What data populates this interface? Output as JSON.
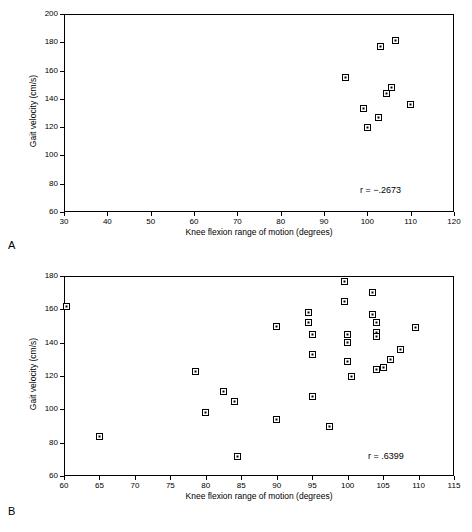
{
  "figure": {
    "panels": [
      {
        "letter": "A",
        "annotation": "r = −.2673",
        "chart_data": {
          "type": "scatter",
          "title": "",
          "xlabel": "Knee flexion range of motion (degrees)",
          "ylabel": "Gait velocity (cm/s)",
          "xlim": [
            30,
            120
          ],
          "ylim": [
            60,
            200
          ],
          "xticks": [
            30,
            40,
            50,
            60,
            70,
            80,
            90,
            100,
            110,
            120
          ],
          "yticks": [
            60,
            80,
            100,
            120,
            140,
            160,
            180,
            200
          ],
          "grid": false,
          "legend": "none",
          "annotations": [
            "r = −.2673"
          ],
          "points": [
            {
              "x": 95.0,
              "y": 155.0
            },
            {
              "x": 99.0,
              "y": 133.0
            },
            {
              "x": 100.0,
              "y": 120.0
            },
            {
              "x": 102.5,
              "y": 127.0
            },
            {
              "x": 103.0,
              "y": 177.0
            },
            {
              "x": 104.5,
              "y": 144.0
            },
            {
              "x": 105.5,
              "y": 148.0
            },
            {
              "x": 106.5,
              "y": 181.0
            },
            {
              "x": 110.0,
              "y": 136.0
            }
          ]
        }
      },
      {
        "letter": "B",
        "annotation": "r = .6399",
        "chart_data": {
          "type": "scatter",
          "title": "",
          "xlabel": "Knee flexion range of motion (degrees)",
          "ylabel": "Gait velocity (cm/s)",
          "xlim": [
            60,
            115
          ],
          "ylim": [
            60,
            180
          ],
          "xticks": [
            60,
            65,
            70,
            75,
            80,
            85,
            90,
            95,
            100,
            105,
            110,
            115
          ],
          "yticks": [
            60,
            80,
            100,
            120,
            140,
            160,
            180
          ],
          "grid": false,
          "legend": "none",
          "annotations": [
            "r = .6399"
          ],
          "points": [
            {
              "x": 60.3,
              "y": 162.0
            },
            {
              "x": 65.0,
              "y": 84.0
            },
            {
              "x": 78.5,
              "y": 123.0
            },
            {
              "x": 80.0,
              "y": 98.0
            },
            {
              "x": 82.5,
              "y": 111.0
            },
            {
              "x": 84.0,
              "y": 105.0
            },
            {
              "x": 84.5,
              "y": 72.0
            },
            {
              "x": 90.0,
              "y": 150.0
            },
            {
              "x": 90.0,
              "y": 94.0
            },
            {
              "x": 94.5,
              "y": 158.0
            },
            {
              "x": 94.5,
              "y": 152.0
            },
            {
              "x": 95.0,
              "y": 145.0
            },
            {
              "x": 95.0,
              "y": 133.0
            },
            {
              "x": 95.0,
              "y": 108.0
            },
            {
              "x": 97.5,
              "y": 90.0
            },
            {
              "x": 99.5,
              "y": 177.0
            },
            {
              "x": 99.5,
              "y": 165.0
            },
            {
              "x": 100.0,
              "y": 145.0
            },
            {
              "x": 100.0,
              "y": 140.0
            },
            {
              "x": 100.0,
              "y": 129.0
            },
            {
              "x": 100.5,
              "y": 120.0
            },
            {
              "x": 103.5,
              "y": 170.0
            },
            {
              "x": 103.5,
              "y": 157.0
            },
            {
              "x": 104.0,
              "y": 152.0
            },
            {
              "x": 104.0,
              "y": 146.0
            },
            {
              "x": 104.0,
              "y": 144.0
            },
            {
              "x": 104.0,
              "y": 124.0
            },
            {
              "x": 105.0,
              "y": 125.0
            },
            {
              "x": 106.0,
              "y": 130.0
            },
            {
              "x": 107.5,
              "y": 136.0
            },
            {
              "x": 109.5,
              "y": 149.0
            }
          ]
        }
      }
    ]
  }
}
